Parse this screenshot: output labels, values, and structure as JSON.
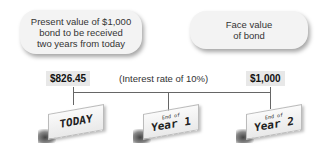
{
  "bubbles": {
    "left": {
      "lines": [
        "Present value of $1,000",
        "bond to be received",
        "two years from today"
      ]
    },
    "right": {
      "lines": [
        "Face value",
        "of bond"
      ]
    }
  },
  "values": {
    "present_value": "$826.45",
    "face_value": "$1,000",
    "interest_rate_note": "(Interest rate of 10%)"
  },
  "timeline": {
    "points": [
      {
        "small": "",
        "big": "TODAY"
      },
      {
        "small": "End of",
        "big": "Year 1"
      },
      {
        "small": "End of",
        "big": "Year 2"
      }
    ]
  }
}
